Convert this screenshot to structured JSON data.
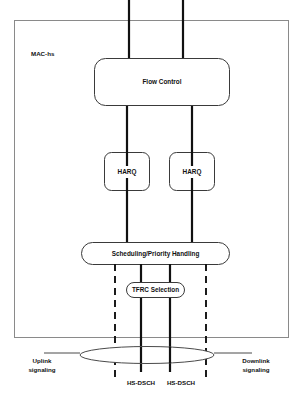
{
  "diagram": {
    "region": {
      "label": "MAC-hs"
    },
    "blocks": {
      "flow_control": "Flow Control",
      "harq_left": "HARQ",
      "harq_right": "HARQ",
      "scheduling": "Scheduling/Priority Handling",
      "tfrc": "TFRC Selection"
    },
    "annotations": {
      "uplink_line1": "Uplink",
      "uplink_line2": "signaling",
      "downlink_line1": "Downlink",
      "downlink_line2": "signaling",
      "channel_left": "HS-DSCH",
      "channel_right": "HS-DSCH"
    },
    "colors": {
      "line": "#111111",
      "box_stroke": "#3a3a3a",
      "region_stroke": "#8a8a8a",
      "background": "#ffffff",
      "text": "#111111"
    }
  }
}
